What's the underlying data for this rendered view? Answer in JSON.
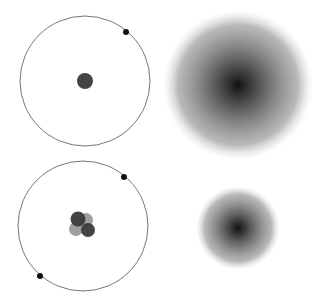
{
  "diagram": {
    "type": "atomic models comparison",
    "panels": [
      {
        "id": "hydrogen-bohr",
        "orbit": {
          "cx": 85,
          "cy": 81,
          "r": 65
        },
        "nucleus": [
          {
            "cx": 85,
            "cy": 81,
            "r": 8,
            "color": "#3a3a3a"
          }
        ],
        "electrons": [
          {
            "cx": 126,
            "cy": 32,
            "r": 3
          }
        ]
      },
      {
        "id": "hydrogen-cloud",
        "cloud": {
          "cx": 238,
          "cy": 85,
          "r": 75
        }
      },
      {
        "id": "helium-bohr",
        "orbit": {
          "cx": 83,
          "cy": 226,
          "r": 65
        },
        "nucleus": [
          {
            "cx": 86,
            "cy": 220,
            "r": 7,
            "color": "#9a9a9a"
          },
          {
            "cx": 76,
            "cy": 229,
            "r": 7,
            "color": "#9a9a9a"
          },
          {
            "cx": 78,
            "cy": 219,
            "r": 7.5,
            "color": "#3a3a3a"
          },
          {
            "cx": 88,
            "cy": 230,
            "r": 7,
            "color": "#3a3a3a"
          }
        ],
        "electrons": [
          {
            "cx": 124,
            "cy": 177,
            "r": 3
          },
          {
            "cx": 40,
            "cy": 276,
            "r": 3
          }
        ]
      },
      {
        "id": "helium-cloud",
        "cloud": {
          "cx": 238,
          "cy": 228,
          "r": 42
        }
      }
    ],
    "colors": {
      "orbit": "#777777",
      "electron": "#111111",
      "cloud_center": "#111111"
    }
  }
}
